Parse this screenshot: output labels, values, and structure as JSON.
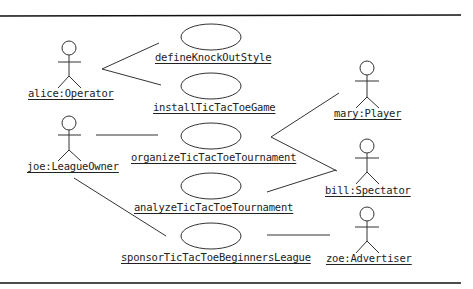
{
  "diagram": {
    "type": "UML use case instance diagram",
    "actors": [
      {
        "id": "alice",
        "label": "alice:Operator"
      },
      {
        "id": "joe",
        "label": "joe:LeagueOwner"
      },
      {
        "id": "mary",
        "label": "mary:Player"
      },
      {
        "id": "bill",
        "label": "bill:Spectator"
      },
      {
        "id": "zoe",
        "label": "zoe:Advertiser"
      }
    ],
    "use_cases": [
      {
        "id": "uc1",
        "label": "defineKnockOutStyle"
      },
      {
        "id": "uc2",
        "label": "installTicTacToeGame"
      },
      {
        "id": "uc3",
        "label": "organizeTicTacToeTournament"
      },
      {
        "id": "uc4",
        "label": "analyzeTicTacToeTournament"
      },
      {
        "id": "uc5",
        "label": "sponsorTicTacToeBeginnersLeague"
      }
    ],
    "associations": [
      [
        "alice",
        "uc1"
      ],
      [
        "alice",
        "uc2"
      ],
      [
        "joe",
        "uc3"
      ],
      [
        "joe",
        "uc5"
      ],
      [
        "mary",
        "uc3"
      ],
      [
        "bill",
        "uc3"
      ],
      [
        "bill",
        "uc4"
      ],
      [
        "zoe",
        "uc5"
      ]
    ]
  }
}
